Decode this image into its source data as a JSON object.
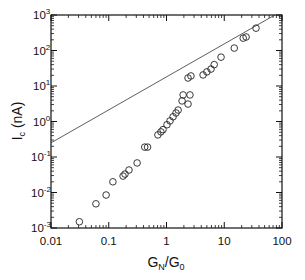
{
  "chart_data": {
    "type": "scatter",
    "title": "",
    "xlabel": "G_N/G_0",
    "ylabel": "I_c (nA)",
    "xscale": "log",
    "yscale": "log",
    "xlim": [
      0.01,
      100
    ],
    "ylim": [
      0.001,
      1000
    ],
    "grid": false,
    "legend": null,
    "x_tick_labels": [
      "0.01",
      "0.1",
      "1",
      "10",
      "100"
    ],
    "y_tick_labels": [
      "10^-3",
      "10^-2",
      "10^-1",
      "10^0",
      "10^1",
      "10^2",
      "10^3"
    ],
    "series": [
      {
        "name": "data",
        "marker": "open-circle",
        "points": [
          [
            0.031,
            0.0015
          ],
          [
            0.06,
            0.0048
          ],
          [
            0.09,
            0.0085
          ],
          [
            0.118,
            0.02
          ],
          [
            0.177,
            0.029
          ],
          [
            0.191,
            0.033
          ],
          [
            0.224,
            0.043
          ],
          [
            0.31,
            0.068
          ],
          [
            0.42,
            0.19
          ],
          [
            0.47,
            0.19
          ],
          [
            0.71,
            0.42
          ],
          [
            0.8,
            0.51
          ],
          [
            0.87,
            0.59
          ],
          [
            1.02,
            0.81
          ],
          [
            1.15,
            1.04
          ],
          [
            1.3,
            1.36
          ],
          [
            1.46,
            1.74
          ],
          [
            1.59,
            2.1
          ],
          [
            1.86,
            3.8
          ],
          [
            1.94,
            5.6
          ],
          [
            2.36,
            3.1
          ],
          [
            2.55,
            5.6
          ],
          [
            2.36,
            16.8
          ],
          [
            2.65,
            19.2
          ],
          [
            4.3,
            20.5
          ],
          [
            5.0,
            25
          ],
          [
            5.9,
            30
          ],
          [
            6.7,
            40
          ],
          [
            8.8,
            65
          ],
          [
            14.9,
            117
          ],
          [
            21.3,
            223
          ],
          [
            23.9,
            240
          ],
          [
            35.5,
            426
          ]
        ]
      },
      {
        "name": "reference line",
        "style": "thin-solid-line",
        "points": [
          [
            0.01,
            0.25
          ],
          [
            75,
            1000
          ]
        ]
      }
    ]
  },
  "axes": {
    "x_label_main": "G",
    "x_label_sub1": "N",
    "x_label_slash": "/G",
    "x_label_sub2": "0",
    "y_label_main": "I",
    "y_label_sub": "c",
    "y_label_unit": " (nA)",
    "x_ticks": [
      "0.01",
      "0.1",
      "1",
      "10",
      "100"
    ],
    "y_ticks": [
      {
        "base": "10",
        "exp": "-3"
      },
      {
        "base": "10",
        "exp": "-2"
      },
      {
        "base": "10",
        "exp": "-1"
      },
      {
        "base": "10",
        "exp": "0"
      },
      {
        "base": "10",
        "exp": "1"
      },
      {
        "base": "10",
        "exp": "2"
      },
      {
        "base": "10",
        "exp": "3"
      }
    ]
  }
}
